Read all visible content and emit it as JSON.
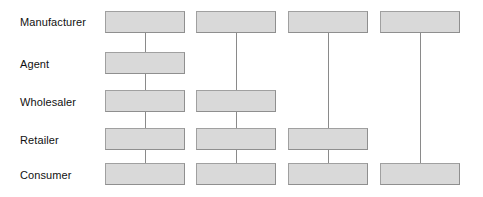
{
  "diagram": {
    "canvas": {
      "width": 483,
      "height": 197,
      "background": "#ffffff"
    },
    "style": {
      "box_fill": "#d9d9d9",
      "box_border": "#8f8f8f",
      "connector_color": "#8a8a8a",
      "label_color": "#111111",
      "box_width": 80,
      "box_height": 22
    },
    "rows": [
      {
        "id": "manufacturer",
        "label": "Manufacturer",
        "label_y": 16,
        "box_y": 11
      },
      {
        "id": "agent",
        "label": "Agent",
        "label_y": 58,
        "box_y": 52
      },
      {
        "id": "wholesaler",
        "label": "Wholesaler",
        "label_y": 96,
        "box_y": 90
      },
      {
        "id": "retailer",
        "label": "Retailer",
        "label_y": 134,
        "box_y": 128
      },
      {
        "id": "consumer",
        "label": "Consumer",
        "label_y": 169,
        "box_y": 163
      }
    ],
    "columns": [
      {
        "id": "channel-1",
        "x": 105,
        "nodes": [
          "manufacturer",
          "agent",
          "wholesaler",
          "retailer",
          "consumer"
        ]
      },
      {
        "id": "channel-2",
        "x": 196,
        "nodes": [
          "manufacturer",
          "wholesaler",
          "retailer",
          "consumer"
        ]
      },
      {
        "id": "channel-3",
        "x": 288,
        "nodes": [
          "manufacturer",
          "retailer",
          "consumer"
        ]
      },
      {
        "id": "channel-4",
        "x": 380,
        "nodes": [
          "manufacturer",
          "consumer"
        ]
      }
    ]
  }
}
